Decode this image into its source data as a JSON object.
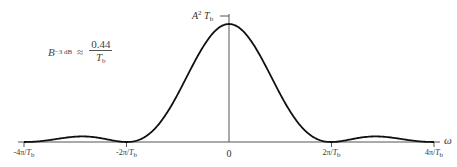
{
  "diagram": {
    "peak_label": {
      "base": "A",
      "sup": "2",
      "var": "T",
      "sub": "b"
    },
    "bandwidth_annotation": {
      "lhs_var": "B",
      "lhs_sub": "−3 dB",
      "relation": "≈",
      "numerator": "0.44",
      "denominator_var": "T",
      "denominator_sub": "b"
    },
    "x_axis_label": "ω",
    "ticks": [
      {
        "value": "-4π",
        "label": "-4π/",
        "var": "T",
        "sub": "b"
      },
      {
        "value": "-2π",
        "label": "-2π/",
        "var": "T",
        "sub": "b"
      },
      {
        "value": "0",
        "label": "0",
        "var": "",
        "sub": ""
      },
      {
        "value": "2π",
        "label": "2π/",
        "var": "T",
        "sub": "b"
      },
      {
        "value": "4π",
        "label": "4π/",
        "var": "T",
        "sub": "b"
      }
    ],
    "curve": {
      "function": "A^2 T_b sinc^2(ω T_b / 2)",
      "x_range_units_of_pi_over_Tb": [
        -4,
        4
      ]
    },
    "colors": {
      "curve": "#111111",
      "axis": "#555555"
    }
  }
}
